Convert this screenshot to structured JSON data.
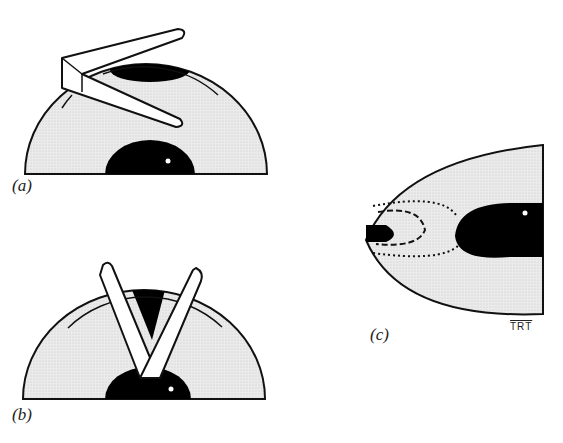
{
  "panels": [
    {
      "id": "a",
      "label": "(a)",
      "description": "Hemispherical dome with a single folded flap inserted at the upper left, showing dark region at top and dark half-disc at base"
    },
    {
      "id": "b",
      "label": "(b)",
      "description": "Hemispherical dome with two blades forming a V converging at the base dark region"
    },
    {
      "id": "c",
      "label": "(c)",
      "description": "Parabolic section with dark elongated ellipse on right, dark wedge on left, dotted and dashed contour lines"
    }
  ],
  "signature": "TRT",
  "colors": {
    "fill": "#e4e4e4",
    "dark": "#000000",
    "outline": "#111111",
    "blade": "#ffffff"
  }
}
